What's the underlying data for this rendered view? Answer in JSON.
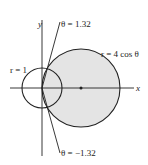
{
  "diagram": {
    "labels": {
      "y_axis": "y",
      "x_axis": "x",
      "theta_upper": "θ = 1.32",
      "theta_lower": "θ = −1.32",
      "small_circle": "r = 1",
      "large_circle": "r = 4 cos θ"
    },
    "colors": {
      "stroke": "#222222",
      "shade": "#e4e4e4",
      "background": "#ffffff"
    },
    "geometry": {
      "origin": [
        42,
        88
      ],
      "small_circle_radius": 20,
      "large_circle_center": [
        81,
        88
      ],
      "large_circle_radius": 39
    }
  }
}
